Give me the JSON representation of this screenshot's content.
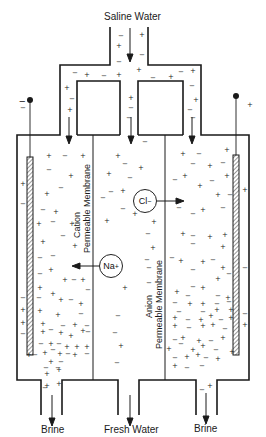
{
  "diagram": {
    "labels": {
      "inlet": "Saline Water",
      "outlet_left": "Brine",
      "outlet_center": "Fresh Water",
      "outlet_right": "Brine"
    },
    "membranes": {
      "left": {
        "line1": "Cation",
        "line2": "Permeable Membrane"
      },
      "right": {
        "line1": "Anion",
        "line2": "Permeable Membrane"
      }
    },
    "ions": {
      "chloride": {
        "symbol": "Cl",
        "charge": "−",
        "direction": "right"
      },
      "sodium": {
        "symbol": "Na",
        "charge": "+",
        "direction": "left"
      }
    },
    "electrodes": {
      "left": {
        "polarity": "−"
      },
      "right": {
        "polarity": "+"
      }
    },
    "colors": {
      "line": "#1a1a1a",
      "background": "#ffffff"
    }
  }
}
